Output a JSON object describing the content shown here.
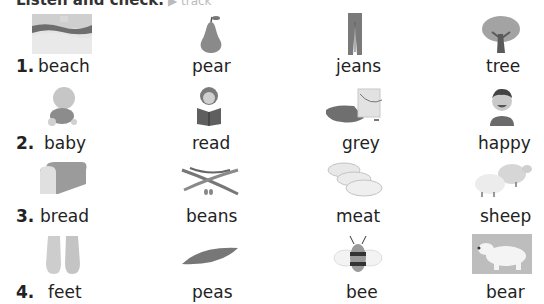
{
  "title": {
    "instruction": "Listen and check.",
    "sub": "▶ track"
  },
  "rows": [
    {
      "number": "1.",
      "items": [
        {
          "word": "beach",
          "icon": "beach-icon"
        },
        {
          "word": "pear",
          "icon": "pear-icon"
        },
        {
          "word": "jeans",
          "icon": "jeans-icon"
        },
        {
          "word": "tree",
          "icon": "tree-icon"
        }
      ]
    },
    {
      "number": "2.",
      "items": [
        {
          "word": "baby",
          "icon": "baby-icon"
        },
        {
          "word": "read",
          "icon": "reading-icon"
        },
        {
          "word": "grey",
          "icon": "paint-bucket-icon"
        },
        {
          "word": "happy",
          "icon": "happy-boy-icon"
        }
      ]
    },
    {
      "number": "3.",
      "items": [
        {
          "word": "bread",
          "icon": "bread-icon"
        },
        {
          "word": "beans",
          "icon": "beans-icon"
        },
        {
          "word": "meat",
          "icon": "meat-icon"
        },
        {
          "word": "sheep",
          "icon": "sheep-icon"
        }
      ]
    },
    {
      "number": "4.",
      "items": [
        {
          "word": "feet",
          "icon": "feet-icon"
        },
        {
          "word": "peas",
          "icon": "peapod-icon"
        },
        {
          "word": "bee",
          "icon": "bee-icon"
        },
        {
          "word": "bear",
          "icon": "polar-bear-icon"
        }
      ]
    }
  ]
}
